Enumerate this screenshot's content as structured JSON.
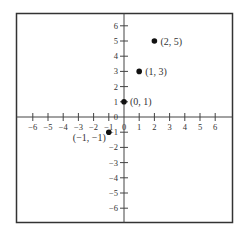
{
  "chart_data": {
    "type": "scatter",
    "title": "",
    "xlabel": "",
    "ylabel": "",
    "xlim": [
      -7,
      7
    ],
    "ylim": [
      -7,
      7
    ],
    "grid": false,
    "legend": null,
    "x_ticks": [
      -6,
      -5,
      -4,
      -3,
      -2,
      -1,
      0,
      1,
      2,
      3,
      4,
      5,
      6
    ],
    "y_ticks": [
      -6,
      -5,
      -4,
      -3,
      -2,
      -1,
      0,
      1,
      2,
      3,
      4,
      5,
      6
    ],
    "x_tick_labels": [
      "−6",
      "−5",
      "−4",
      "−3",
      "−2",
      "−1",
      "0",
      "1",
      "2",
      "3",
      "4",
      "5",
      "6"
    ],
    "y_tick_labels": [
      "−6",
      "−5",
      "−4",
      "−3",
      "−2",
      "−1",
      "0",
      "1",
      "2",
      "3",
      "4",
      "5",
      "6"
    ],
    "series": [
      {
        "name": "points",
        "points": [
          {
            "x": -1,
            "y": -1,
            "label": "(−1, −1)",
            "label_pos": "below-left"
          },
          {
            "x": 0,
            "y": 1,
            "label": "(0, 1)",
            "label_pos": "right"
          },
          {
            "x": 1,
            "y": 3,
            "label": "(1, 3)",
            "label_pos": "right"
          },
          {
            "x": 2,
            "y": 5,
            "label": "(2, 5)",
            "label_pos": "right"
          }
        ]
      }
    ],
    "colors": {
      "frame": "#333333",
      "axis": "#444444",
      "point": "#111111",
      "text": "#333333"
    }
  }
}
